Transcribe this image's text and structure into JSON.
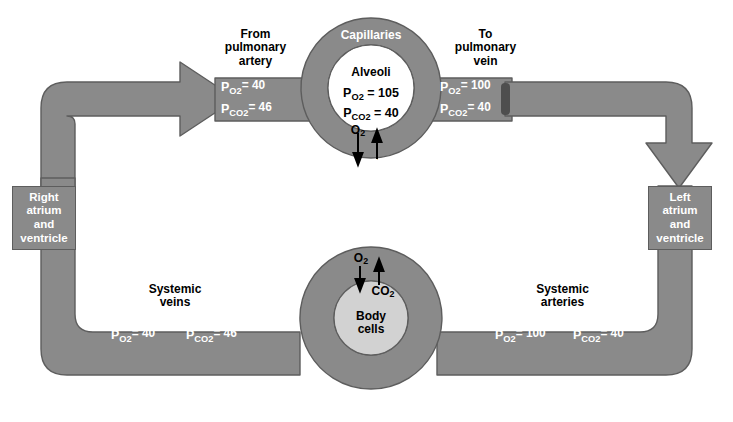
{
  "diagram": {
    "colors": {
      "vessel": "#8a8a8a",
      "vessel_stroke": "#5d5d5d",
      "alveoli_fill": "#ffffff",
      "body_cells_fill": "#d2d2d2",
      "text_on_vessel": "#ffffff",
      "text_plain": "#000000",
      "background": "#ffffff"
    },
    "pulmonary": {
      "capillaries_label": "Capillaries",
      "alveoli_label": "Alveoli",
      "alveoli_po2_symbol": "P",
      "alveoli_po2_sub": "O",
      "alveoli_po2_sub2": "2",
      "alveoli_po2_value": "= 105",
      "alveoli_pco2_symbol": "P",
      "alveoli_pco2_sub": "CO",
      "alveoli_pco2_sub2": "2",
      "alveoli_pco2_value": "= 40",
      "gas_in_label": "O",
      "gas_in_sub": "2",
      "gas_out_label": "CO",
      "gas_out_sub": "2",
      "inflow_title_line1": "From",
      "inflow_title_line2": "pulmonary",
      "inflow_title_line3": "artery",
      "inflow_po2": "= 40",
      "inflow_pco2": "= 46",
      "outflow_title_line1": "To",
      "outflow_title_line2": "pulmonary",
      "outflow_title_line3": "vein",
      "outflow_po2": "= 100",
      "outflow_pco2": "= 40"
    },
    "systemic": {
      "body_cells_line1": "Body",
      "body_cells_line2": "cells",
      "gas_in_label": "O",
      "gas_in_sub": "2",
      "gas_out_label": "CO",
      "gas_out_sub": "2",
      "veins_title_line1": "Systemic",
      "veins_title_line2": "veins",
      "veins_po2": "= 40",
      "veins_pco2": "= 46",
      "arteries_title_line1": "Systemic",
      "arteries_title_line2": "arteries",
      "arteries_po2": "= 100",
      "arteries_pco2": "= 40"
    },
    "heart": {
      "right_line1": "Right",
      "right_line2": "atrium",
      "right_line3": "and",
      "right_line4": "ventricle",
      "left_line1": "Left",
      "left_line2": "atrium",
      "left_line3": "and",
      "left_line4": "ventricle"
    },
    "symbols": {
      "p": "P",
      "o2_sub": "O",
      "co2_sub": "CO",
      "two": "2"
    }
  }
}
